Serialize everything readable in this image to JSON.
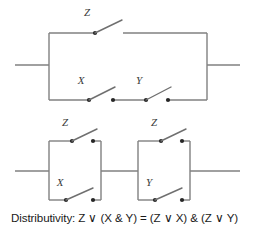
{
  "figure": {
    "line_color": "#808080",
    "node_color": "#262626",
    "label_color": "#3a3a3a",
    "background": "#ffffff"
  },
  "circuits": {
    "top": {
      "name": "Z OR (X AND Y)",
      "branches": [
        {
          "name": "upper-branch",
          "switches": [
            "Z"
          ]
        },
        {
          "name": "lower-branch",
          "switches": [
            "X",
            "Y"
          ]
        }
      ]
    },
    "bottom_left": {
      "name": "Z OR X",
      "branches": [
        {
          "name": "upper-branch",
          "switches": [
            "Z"
          ]
        },
        {
          "name": "lower-branch",
          "switches": [
            "X"
          ]
        }
      ]
    },
    "bottom_right": {
      "name": "Z OR Y",
      "branches": [
        {
          "name": "upper-branch",
          "switches": [
            "Z"
          ]
        },
        {
          "name": "lower-branch",
          "switches": [
            "Y"
          ]
        }
      ]
    }
  },
  "labels": {
    "top_z": "Z",
    "top_x": "X",
    "top_y": "Y",
    "bl_z": "Z",
    "bl_x": "X",
    "br_z": "Z",
    "br_y": "Y"
  },
  "caption": {
    "full": "Distributivity: Z ∨ (X & Y) = (Z ∨ X) & (Z ∨ Y)",
    "term": "Distributivity:",
    "left_side": "Z ∨ (X & Y)",
    "relation": "=",
    "right_side": "(Z ∨ X) & (Z ∨ Y)"
  }
}
